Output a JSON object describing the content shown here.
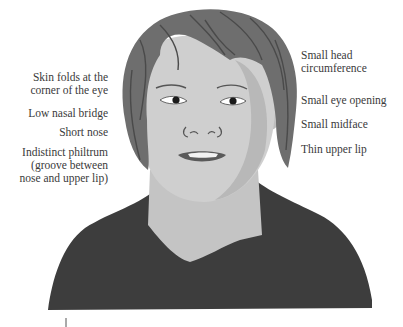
{
  "figure": {
    "colors": {
      "background": "#ffffff",
      "skin": "#cfcfcf",
      "skin_shadow": "#b8b8b8",
      "hair": "#6e6e6e",
      "hair_dark": "#4a4a4a",
      "shirt": "#3d3d3d",
      "neck": "#c4c4c4",
      "lip": "#5a5a5a",
      "text": "#3a3a3a"
    }
  },
  "labels": {
    "left": [
      {
        "lines": [
          "Skin folds at the",
          "corner of the eye"
        ]
      },
      {
        "lines": [
          "Low nasal bridge"
        ]
      },
      {
        "lines": [
          "Short nose"
        ]
      },
      {
        "lines": [
          "Indistinct philtrum",
          "(groove between",
          "nose and upper lip)"
        ]
      }
    ],
    "right": [
      {
        "lines": [
          "Small head",
          "circumference"
        ]
      },
      {
        "lines": [
          "Small eye opening"
        ]
      },
      {
        "lines": [
          "Small midface"
        ]
      },
      {
        "lines": [
          "Thin upper lip"
        ]
      }
    ]
  }
}
